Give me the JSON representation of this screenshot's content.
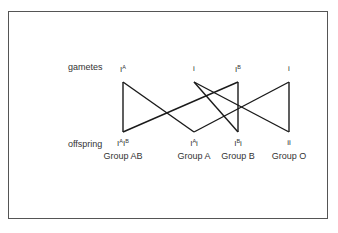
{
  "diagram": {
    "row_labels": {
      "gametes": "gametes",
      "offspring": "offspring"
    },
    "gametes": [
      {
        "base": "I",
        "sup": "A",
        "x": 123
      },
      {
        "base": "i",
        "sup": "",
        "x": 194
      },
      {
        "base": "I",
        "sup": "B",
        "x": 238
      },
      {
        "base": "i",
        "sup": "",
        "x": 289
      }
    ],
    "offspring": [
      {
        "genotype_html": "I<sup>A</sup>I<sup>B</sup>",
        "genotype": "IAIB",
        "group": "Group AB",
        "x": 123
      },
      {
        "genotype_html": "I<sup>A</sup>i",
        "genotype": "IAi",
        "group": "Group A",
        "x": 194
      },
      {
        "genotype_html": "I<sup>B</sup>i",
        "genotype": "IBi",
        "group": "Group B",
        "x": 238
      },
      {
        "genotype_html": "ii",
        "genotype": "ii",
        "group": "Group O",
        "x": 289
      }
    ],
    "connections": [
      {
        "from": 0,
        "to": 0
      },
      {
        "from": 0,
        "to": 1
      },
      {
        "from": 1,
        "to": 2
      },
      {
        "from": 1,
        "to": 3
      },
      {
        "from": 2,
        "to": 0
      },
      {
        "from": 2,
        "to": 2
      },
      {
        "from": 3,
        "to": 1
      },
      {
        "from": 3,
        "to": 3
      }
    ],
    "line_color": "#1a1a1a"
  }
}
